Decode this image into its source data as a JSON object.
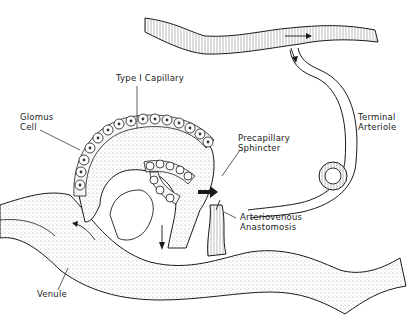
{
  "figure": {
    "labels": {
      "type1_capillary": "Type I Capillary",
      "glomus_cell_line1": "Glomus",
      "glomus_cell_line2": "Cell",
      "precapillary_line1": "Precapillary",
      "precapillary_line2": "Sphincter",
      "terminal_line1": "Terminal",
      "terminal_line2": "Arteriole",
      "av_line1": "Arteriovenous",
      "av_line2": "Anastomosis",
      "venule": "Venule"
    },
    "colors": {
      "ink": "#1a1a1a",
      "stipple": "#bdbdbd",
      "background": "#ffffff"
    }
  }
}
